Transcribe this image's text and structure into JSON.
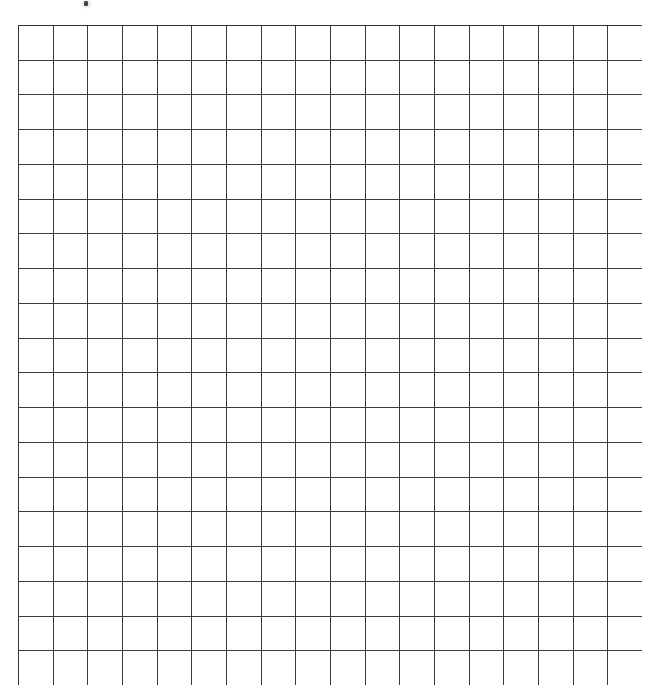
{
  "document": {
    "title": "Blank Grid Worksheet",
    "page_background": "#ffffff",
    "type": "blank-grid"
  },
  "grid": {
    "name": "blank-square-grid",
    "columns": 18,
    "rows": 19,
    "cell_width_px": 34.7,
    "cell_height_px": 34.7,
    "origin_x_px": 18,
    "origin_y_px": 25,
    "total_width_px": 624,
    "total_height_px": 660,
    "line_color": "#3b3b3b",
    "outer_line_color": "#333333",
    "line_width_px": 1.6,
    "cell_fill": "#ffffff",
    "cell_text": ""
  },
  "artifact": {
    "name": "ink-speck",
    "x_px": 84,
    "y_px": 1,
    "width_px": 4,
    "height_px": 5,
    "color": "#3a3a3a"
  },
  "chart_data": {
    "type": "table",
    "title": "",
    "xlabel": "",
    "ylabel": "",
    "columns": 18,
    "rows": 19,
    "values": [],
    "grid": true,
    "legend": "none",
    "note": "Empty grid - no data plotted, all cells blank"
  }
}
